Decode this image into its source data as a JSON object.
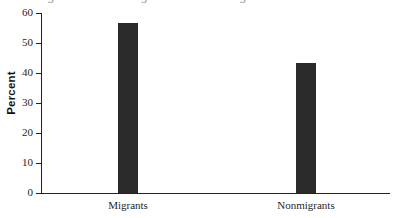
{
  "figure": {
    "title_remnant": "Figure: Percent Migrants and Nonmigrants",
    "background_color": "#ffffff"
  },
  "chart_data": {
    "type": "bar",
    "title": "",
    "xlabel": "",
    "ylabel": "Percent",
    "categories": [
      "Migrants",
      "Nonmigrants"
    ],
    "values": [
      56.8,
      43.2
    ],
    "ylim": [
      0,
      60
    ],
    "yticks": [
      0,
      10,
      20,
      30,
      40,
      50,
      60
    ],
    "ytick_labels": [
      "0",
      "10",
      "20",
      "30",
      "40",
      "50",
      "60"
    ],
    "grid": false,
    "legend": false,
    "bar_color": "#2b2b2b",
    "axis_color": "#232323"
  }
}
